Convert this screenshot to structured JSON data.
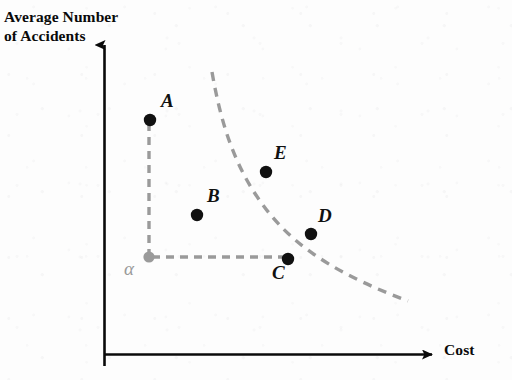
{
  "figure": {
    "title": "",
    "background_color": "#fdfdfd",
    "axis_color": "#0a0a0a",
    "point_color": "#111111",
    "guide_color": "#9a9a9a",
    "curve_color": "#9a9a9a"
  },
  "axes": {
    "y_label": "Average Number\nof Accidents",
    "x_label": "Cost",
    "y_label_name": "average-number-of-accidents",
    "x_label_name": "cost"
  },
  "corner": {
    "label": "α",
    "x": 149,
    "y": 257
  },
  "chart_data": {
    "type": "scatter",
    "title": "",
    "xlabel": "Cost",
    "ylabel": "Average Number of Accidents",
    "xlim": [
      0,
      1
    ],
    "ylim": [
      0,
      1
    ],
    "grid": false,
    "legend": null,
    "points": [
      {
        "label": "A",
        "x": 150,
        "y": 120,
        "label_x": 161,
        "label_y": 90
      },
      {
        "label": "B",
        "x": 197,
        "y": 215,
        "label_x": 207,
        "label_y": 185
      },
      {
        "label": "C",
        "x": 288,
        "y": 259,
        "label_x": 272,
        "label_y": 262
      },
      {
        "label": "D",
        "x": 311,
        "y": 234,
        "label_x": 318,
        "label_y": 205
      },
      {
        "label": "E",
        "x": 266,
        "y": 172,
        "label_x": 274,
        "label_y": 142
      }
    ],
    "curve": {
      "name": "indifference-curve",
      "style": "dashed",
      "path": "M 212 72 C 220 118, 232 160, 258 198 C 284 236, 320 268, 408 301"
    },
    "guide_lines": [
      {
        "name": "vertical-guide-alpha-to-a",
        "x1": 149,
        "y1": 123,
        "x2": 149,
        "y2": 254
      },
      {
        "name": "horizontal-guide-alpha-to-c",
        "x1": 152,
        "y1": 257,
        "x2": 285,
        "y2": 257
      }
    ],
    "axis_lines": {
      "y_axis": {
        "x": 104.5,
        "y_top": 38,
        "y_bottom": 366
      },
      "x_axis": {
        "y": 354.5,
        "x_left": 104.5,
        "x_right": 441
      }
    }
  }
}
